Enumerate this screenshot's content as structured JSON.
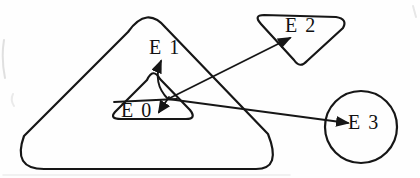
{
  "diagram": {
    "background_color": "#fefefe",
    "line_color": "#161616",
    "label_color": "#111111",
    "nodes": {
      "e0": {
        "label": "E 0",
        "shape": "small-rounded-triangle",
        "contained_in": "outer-triangle"
      },
      "e1": {
        "label": "E 1",
        "shape": "label-only",
        "contained_in": "outer-triangle"
      },
      "e2": {
        "label": "E 2",
        "shape": "inverted-rounded-triangle",
        "contained_in": "none"
      },
      "e3": {
        "label": "E 3",
        "shape": "circle",
        "contained_in": "none"
      }
    },
    "arrows": [
      {
        "from": "e0-origin-point",
        "to": "e1",
        "style": "curved-up"
      },
      {
        "from": "e0-origin-point",
        "to": "e0",
        "style": "short-down"
      },
      {
        "from": "e0-origin-point",
        "to": "e2",
        "style": "straight"
      },
      {
        "from": "e0-origin-point",
        "to": "e3",
        "style": "straight"
      }
    ]
  }
}
